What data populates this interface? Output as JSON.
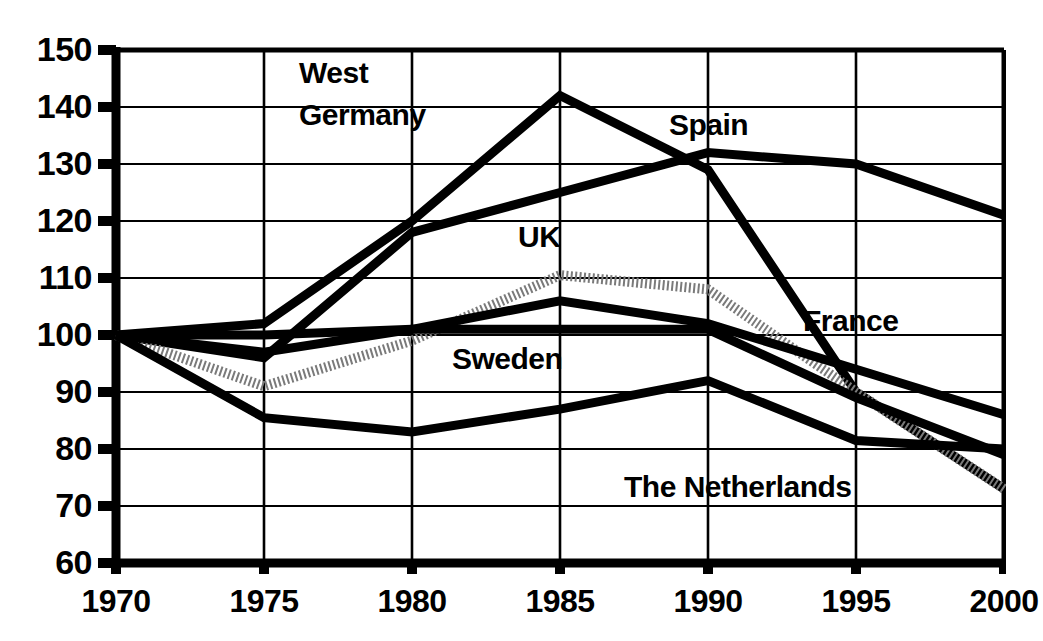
{
  "chart_data": {
    "type": "line",
    "title": "",
    "subtitle": "",
    "xlabel": "",
    "ylabel": "",
    "x": [
      1970,
      1975,
      1980,
      1985,
      1990,
      1995,
      2000
    ],
    "xtick_labels": [
      "1970",
      "1975",
      "1980",
      "1985",
      "1990",
      "1995",
      "2000"
    ],
    "ytick_labels": [
      "150",
      "140",
      "130",
      "120",
      "110",
      "100",
      "90",
      "80",
      "70",
      "60"
    ],
    "ytick_values": [
      150,
      140,
      130,
      120,
      110,
      100,
      90,
      80,
      70,
      60
    ],
    "xlim": [
      1970,
      2000
    ],
    "ylim": [
      60,
      150
    ],
    "grid": true,
    "legend_position": "inline-annotations",
    "series": [
      {
        "name": "The Netherlands",
        "style": "solid-thick",
        "color": "#000000",
        "values": [
          100,
          102,
          120,
          142,
          129,
          90,
          73
        ]
      },
      {
        "name": "Spain",
        "style": "solid-thick",
        "color": "#000000",
        "values": [
          100,
          96,
          118,
          125,
          132,
          130,
          121
        ]
      },
      {
        "name": "UK",
        "style": "dotted-thick",
        "color": "#7a7a7a",
        "values": [
          100,
          91,
          99,
          110.5,
          108,
          90,
          73
        ]
      },
      {
        "name": "France",
        "style": "solid-thick",
        "color": "#000000",
        "values": [
          100,
          97,
          101,
          106,
          102,
          94,
          86
        ]
      },
      {
        "name": "Unlabelled flat series",
        "style": "solid-thick",
        "color": "#000000",
        "values": [
          100,
          100,
          101,
          101,
          101,
          89,
          79
        ]
      },
      {
        "name": "Sweden",
        "style": "solid-thick",
        "color": "#000000",
        "values": [
          100,
          85.5,
          83,
          87,
          92,
          81.5,
          80
        ]
      }
    ],
    "annotations": [
      {
        "text": "West",
        "x_px": 299,
        "y_px": 58
      },
      {
        "text": "Germany",
        "x_px": 299,
        "y_px": 100
      },
      {
        "text": "UK",
        "x_px": 518,
        "y_px": 222
      },
      {
        "text": "Spain",
        "x_px": 669,
        "y_px": 110
      },
      {
        "text": "Sweden",
        "x_px": 452,
        "y_px": 344
      },
      {
        "text": "France",
        "x_px": 803,
        "y_px": 306
      },
      {
        "text": "The Netherlands",
        "x_px": 624,
        "y_px": 472
      }
    ]
  },
  "axes": {
    "y_tick_positions_px": [
      50,
      107,
      164,
      221,
      278,
      335,
      392,
      449,
      506,
      563
    ],
    "x_tick_positions_px": [
      116,
      264,
      412,
      560,
      708,
      856,
      1004
    ]
  }
}
